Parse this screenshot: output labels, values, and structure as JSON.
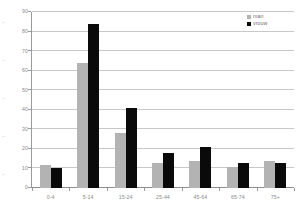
{
  "chart_data": {
    "type": "bar",
    "title": "",
    "subtitle": "",
    "xlabel": "",
    "ylabel": "",
    "categories": [
      "0-4",
      "5-14",
      "15-24",
      "25-44",
      "45-64",
      "65-74",
      "75+"
    ],
    "series": [
      {
        "name": "man",
        "color": "#b3b3b3",
        "values": [
          12,
          64,
          28,
          13,
          14,
          11,
          14
        ]
      },
      {
        "name": "vrouw",
        "color": "#0a0a0a",
        "values": [
          10,
          84,
          41,
          18,
          21,
          13,
          13
        ]
      }
    ],
    "ylim": [
      0,
      90
    ],
    "ytick_labels": [
      "0",
      "10",
      "20",
      "30",
      "40",
      "50",
      "60",
      "70",
      "80",
      "90"
    ],
    "ytick_values": [
      0,
      10,
      20,
      30,
      40,
      50,
      60,
      70,
      80,
      90
    ],
    "grid": true,
    "grid_axis": "y",
    "legend_position": "top-right",
    "annotations": []
  },
  "legend": {
    "entries": [
      {
        "label": "man",
        "swatch_color": "#b3b3b3"
      },
      {
        "label": "vrouw",
        "swatch_color": "#0a0a0a"
      }
    ]
  },
  "colors": {
    "series_man": "#b3b3b3",
    "series_vrouw": "#0a0a0a",
    "gridline": "#c8c8c8",
    "axis": "#9a9a9a",
    "tick_text": "#8a8a8a",
    "legend_text": "#6e6e6e",
    "background": "#ffffff"
  }
}
